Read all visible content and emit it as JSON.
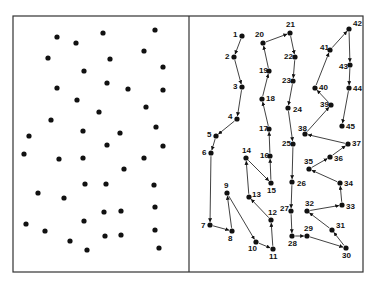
{
  "colors": {
    "ink": "#111111",
    "background": "#ffffff",
    "frame": "#333333"
  },
  "frame": {
    "x": 13,
    "y": 16,
    "width": 350,
    "height": 256,
    "divider_x": 189
  },
  "left_panel": {
    "dots": [
      [
        57,
        37
      ],
      [
        103,
        33
      ],
      [
        155,
        30
      ],
      [
        76,
        43
      ],
      [
        144,
        51
      ],
      [
        48,
        58
      ],
      [
        110,
        59
      ],
      [
        163,
        67
      ],
      [
        84,
        71
      ],
      [
        57,
        88
      ],
      [
        107,
        83
      ],
      [
        128,
        89
      ],
      [
        163,
        90
      ],
      [
        77,
        100
      ],
      [
        146,
        107
      ],
      [
        99,
        112
      ],
      [
        51,
        120
      ],
      [
        156,
        127
      ],
      [
        29,
        136
      ],
      [
        83,
        131
      ],
      [
        120,
        133
      ],
      [
        107,
        145
      ],
      [
        163,
        146
      ],
      [
        24,
        154
      ],
      [
        59,
        159
      ],
      [
        83,
        158
      ],
      [
        144,
        158
      ],
      [
        124,
        169
      ],
      [
        85,
        184
      ],
      [
        106,
        184
      ],
      [
        154,
        185
      ],
      [
        38,
        193
      ],
      [
        64,
        198
      ],
      [
        104,
        212
      ],
      [
        121,
        211
      ],
      [
        155,
        207
      ],
      [
        84,
        221
      ],
      [
        26,
        224
      ],
      [
        45,
        231
      ],
      [
        155,
        230
      ],
      [
        70,
        241
      ],
      [
        105,
        236
      ],
      [
        121,
        235
      ],
      [
        87,
        250
      ],
      [
        159,
        248
      ]
    ]
  },
  "right_panel": {
    "points": [
      {
        "n": "1",
        "x": 242,
        "y": 36
      },
      {
        "n": "2",
        "x": 234,
        "y": 57
      },
      {
        "n": "3",
        "x": 242,
        "y": 87
      },
      {
        "n": "4",
        "x": 237,
        "y": 119
      },
      {
        "n": "5",
        "x": 216,
        "y": 136
      },
      {
        "n": "6",
        "x": 211,
        "y": 153
      },
      {
        "n": "7",
        "x": 210,
        "y": 225
      },
      {
        "n": "8",
        "x": 232,
        "y": 231
      },
      {
        "n": "9",
        "x": 227,
        "y": 193
      },
      {
        "n": "10",
        "x": 256,
        "y": 242
      },
      {
        "n": "11",
        "x": 273,
        "y": 249
      },
      {
        "n": "12",
        "x": 271,
        "y": 220
      },
      {
        "n": "13",
        "x": 249,
        "y": 197
      },
      {
        "n": "14",
        "x": 246,
        "y": 158
      },
      {
        "n": "15",
        "x": 271,
        "y": 183
      },
      {
        "n": "16",
        "x": 270,
        "y": 156
      },
      {
        "n": "17",
        "x": 269,
        "y": 129
      },
      {
        "n": "18",
        "x": 262,
        "y": 99
      },
      {
        "n": "19",
        "x": 269,
        "y": 71
      },
      {
        "n": "20",
        "x": 263,
        "y": 43
      },
      {
        "n": "21",
        "x": 290,
        "y": 33
      },
      {
        "n": "22",
        "x": 295,
        "y": 57
      },
      {
        "n": "23",
        "x": 293,
        "y": 81
      },
      {
        "n": "24",
        "x": 288,
        "y": 108
      },
      {
        "n": "25",
        "x": 293,
        "y": 144
      },
      {
        "n": "26",
        "x": 292,
        "y": 182
      },
      {
        "n": "27",
        "x": 291,
        "y": 211
      },
      {
        "n": "28",
        "x": 292,
        "y": 236
      },
      {
        "n": "29",
        "x": 307,
        "y": 236
      },
      {
        "n": "30",
        "x": 346,
        "y": 248
      },
      {
        "n": "31",
        "x": 332,
        "y": 230
      },
      {
        "n": "32",
        "x": 307,
        "y": 211
      },
      {
        "n": "33",
        "x": 342,
        "y": 205
      },
      {
        "n": "34",
        "x": 340,
        "y": 183
      },
      {
        "n": "35",
        "x": 309,
        "y": 169
      },
      {
        "n": "36",
        "x": 330,
        "y": 157
      },
      {
        "n": "37",
        "x": 348,
        "y": 144
      },
      {
        "n": "38",
        "x": 305,
        "y": 134
      },
      {
        "n": "39",
        "x": 331,
        "y": 105
      },
      {
        "n": "40",
        "x": 315,
        "y": 88
      },
      {
        "n": "41",
        "x": 330,
        "y": 50
      },
      {
        "n": "42",
        "x": 349,
        "y": 29
      },
      {
        "n": "43",
        "x": 350,
        "y": 65
      },
      {
        "n": "44",
        "x": 349,
        "y": 88
      },
      {
        "n": "45",
        "x": 342,
        "y": 126
      }
    ],
    "label_offsets": {
      "1": [
        -9,
        1
      ],
      "2": [
        -9,
        2
      ],
      "3": [
        -9,
        2
      ],
      "4": [
        -9,
        0
      ],
      "5": [
        -9,
        1
      ],
      "6": [
        -9,
        2
      ],
      "7": [
        -9,
        3
      ],
      "8": [
        -4,
        10
      ],
      "9": [
        -3,
        -5
      ],
      "10": [
        -8,
        9
      ],
      "11": [
        -4,
        10
      ],
      "12": [
        -3,
        -5
      ],
      "13": [
        3,
        0
      ],
      "14": [
        -4,
        -5
      ],
      "15": [
        -4,
        10
      ],
      "16": [
        -10,
        2
      ],
      "17": [
        -10,
        2
      ],
      "18": [
        4,
        2
      ],
      "19": [
        -10,
        2
      ],
      "20": [
        -8,
        -6
      ],
      "21": [
        -4,
        -6
      ],
      "22": [
        -11,
        2
      ],
      "23": [
        -11,
        2
      ],
      "24": [
        5,
        4
      ],
      "25": [
        -11,
        2
      ],
      "26": [
        5,
        4
      ],
      "27": [
        -11,
        0
      ],
      "28": [
        -4,
        10
      ],
      "29": [
        -3,
        -5
      ],
      "30": [
        -4,
        10
      ],
      "31": [
        4,
        -2
      ],
      "32": [
        -2,
        -5
      ],
      "33": [
        4,
        4
      ],
      "34": [
        4,
        3
      ],
      "35": [
        -5,
        -5
      ],
      "36": [
        4,
        4
      ],
      "37": [
        4,
        2
      ],
      "38": [
        -7,
        -3
      ],
      "39": [
        -11,
        2
      ],
      "40": [
        4,
        2
      ],
      "41": [
        -10,
        0
      ],
      "42": [
        4,
        -3
      ],
      "43": [
        -11,
        4
      ],
      "44": [
        4,
        3
      ],
      "45": [
        4,
        3
      ]
    }
  }
}
